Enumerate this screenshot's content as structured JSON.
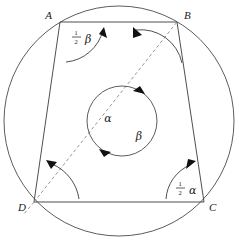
{
  "figure": {
    "background_color": "#ffffff",
    "line_color": "#3b3b3b",
    "dashed_color": "#8a8a8a",
    "arrow_color": "#111111"
  },
  "vertices": [
    {
      "id": "A",
      "label": "A",
      "x": 60,
      "y": 22,
      "label_x": 52,
      "label_y": 18
    },
    {
      "id": "B",
      "label": "B",
      "x": 177,
      "y": 22,
      "label_x": 182,
      "label_y": 18
    },
    {
      "id": "C",
      "label": "C",
      "x": 204,
      "y": 202,
      "label_x": 209,
      "label_y": 210
    },
    {
      "id": "D",
      "label": "D",
      "x": 34,
      "y": 202,
      "label_x": 22,
      "label_y": 210
    }
  ],
  "outer_circle": {
    "name": "circumscribed-circle",
    "cx": 119,
    "cy": 121,
    "r": 115
  },
  "inner_circle": {
    "name": "central-rotation-circle",
    "cx": 122,
    "cy": 121,
    "r": 35
  },
  "diagonal": {
    "name": "diagonal-DB",
    "from": "D",
    "to": "B",
    "style": "dashed"
  },
  "labels": {
    "half_beta": {
      "numerator": "1",
      "denominator": "2",
      "symbol": "β",
      "x": 78,
      "y": 37
    },
    "half_alpha": {
      "numerator": "1",
      "denominator": "2",
      "symbol": "α",
      "x": 182,
      "y": 190
    },
    "alpha_center": {
      "symbol": "α",
      "x": 108,
      "y": 120
    },
    "beta_center": {
      "symbol": "β",
      "x": 138,
      "y": 137
    }
  },
  "angle_arcs": [
    {
      "name": "arc-at-A",
      "vertex": "A",
      "label": "half_beta",
      "arrow": "up-right"
    },
    {
      "name": "arc-at-B",
      "vertex": "B",
      "label": "",
      "arrow": "up-left"
    },
    {
      "name": "arc-at-C",
      "vertex": "C",
      "label": "half_alpha",
      "arrow": "up-right"
    },
    {
      "name": "arc-at-D",
      "vertex": "D",
      "label": "",
      "arrow": "up-left"
    }
  ],
  "rotation_arrows": [
    {
      "name": "inner-arrow-top",
      "position": "top-right-of-inner-circle",
      "direction": "clockwise"
    },
    {
      "name": "inner-arrow-bottom",
      "position": "bottom-left-of-inner-circle",
      "direction": "clockwise"
    }
  ]
}
